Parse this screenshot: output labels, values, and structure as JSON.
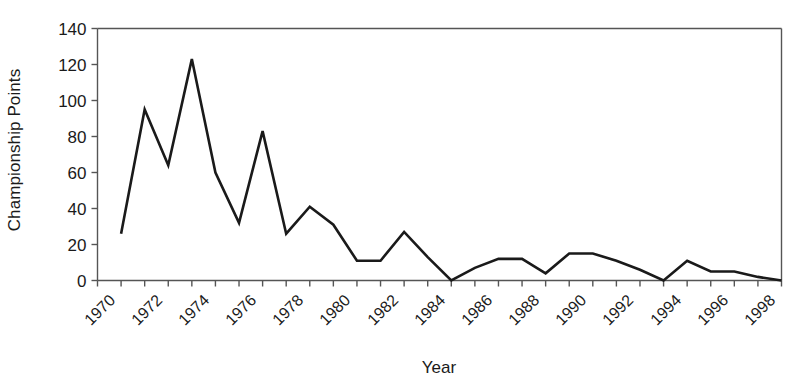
{
  "chart_data": {
    "type": "line",
    "title": "",
    "xlabel": "Year",
    "ylabel": "Championship Points",
    "xlim": [
      1970,
      1999
    ],
    "ylim": [
      0,
      140
    ],
    "ytick_values": [
      0,
      20,
      40,
      60,
      80,
      100,
      120,
      140
    ],
    "ytick_labels": [
      "0",
      "20",
      "40",
      "60",
      "80",
      "100",
      "120",
      "140"
    ],
    "xtick_values": [
      1970,
      1971,
      1972,
      1973,
      1974,
      1975,
      1976,
      1977,
      1978,
      1979,
      1980,
      1981,
      1982,
      1983,
      1984,
      1985,
      1986,
      1987,
      1988,
      1989,
      1990,
      1991,
      1992,
      1993,
      1994,
      1995,
      1996,
      1997,
      1998,
      1999
    ],
    "xtick_labels_shown": [
      "1970",
      "1972",
      "1974",
      "1976",
      "1978",
      "1980",
      "1982",
      "1984",
      "1986",
      "1988",
      "1990",
      "1992",
      "1994",
      "1996",
      "1998"
    ],
    "grid": false,
    "legend": false,
    "line_color": "#1a1a1a",
    "line_width": 2.6,
    "axis_color": "#555555",
    "background_color": "#ffffff",
    "x": [
      1971,
      1972,
      1973,
      1974,
      1975,
      1976,
      1977,
      1978,
      1979,
      1980,
      1981,
      1982,
      1983,
      1984,
      1985,
      1986,
      1987,
      1988,
      1989,
      1990,
      1991,
      1992,
      1993,
      1994,
      1995,
      1996,
      1997,
      1998,
      1999
    ],
    "values": [
      26,
      95,
      64,
      123,
      60,
      32,
      83,
      26,
      41,
      31,
      11,
      11,
      27,
      13,
      0,
      7,
      12,
      12,
      4,
      15,
      15,
      11,
      6,
      0,
      11,
      5,
      5,
      2,
      0
    ],
    "series": [
      {
        "name": "Championship Points",
        "values": [
          26,
          95,
          64,
          123,
          60,
          32,
          83,
          26,
          41,
          31,
          11,
          11,
          27,
          13,
          0,
          7,
          12,
          12,
          4,
          15,
          15,
          11,
          6,
          0,
          11,
          5,
          5,
          2,
          0
        ]
      }
    ]
  },
  "axes": {
    "y_title": "Championship Points",
    "x_title": "Year"
  }
}
